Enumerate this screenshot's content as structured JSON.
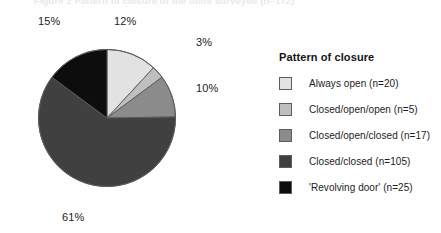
{
  "figure": {
    "cut_caption": "Figure 2  Pattern of closure of the units surveyed (n=172)"
  },
  "legend": {
    "title": "Pattern of closure",
    "entries": [
      {
        "label": "Always open (n=20)",
        "color": "#e2e2e2"
      },
      {
        "label": "Closed/open/open (n=5)",
        "color": "#bfbfbf"
      },
      {
        "label": "Closed/open/closed (n=17)",
        "color": "#8b8b8b"
      },
      {
        "label": "Closed/closed (n=105)",
        "color": "#404040"
      },
      {
        "label": "'Revolving door' (n=25)",
        "color": "#0d0d0d"
      }
    ]
  },
  "callouts": {
    "pct_12": "12%",
    "pct_3": "3%",
    "pct_10": "10%",
    "pct_61": "61%",
    "pct_15": "15%"
  },
  "chart_data": {
    "type": "pie",
    "title": "Pattern of closure",
    "xlabel": "",
    "ylabel": "",
    "start_angle_deg": 0,
    "direction": "clockwise",
    "total_n": 172,
    "categories": [
      "Always open (n=20)",
      "Closed/open/open (n=5)",
      "Closed/open/closed (n=17)",
      "Closed/closed (n=105)",
      "'Revolving door' (n=25)"
    ],
    "values": [
      12,
      3,
      10,
      61,
      15
    ],
    "counts": [
      20,
      5,
      17,
      105,
      25
    ],
    "value_labels": [
      "12%",
      "3%",
      "10%",
      "61%",
      "15%"
    ],
    "colors": [
      "#e2e2e2",
      "#bfbfbf",
      "#8b8b8b",
      "#404040",
      "#0d0d0d"
    ],
    "legend_position": "right",
    "grid": false
  }
}
